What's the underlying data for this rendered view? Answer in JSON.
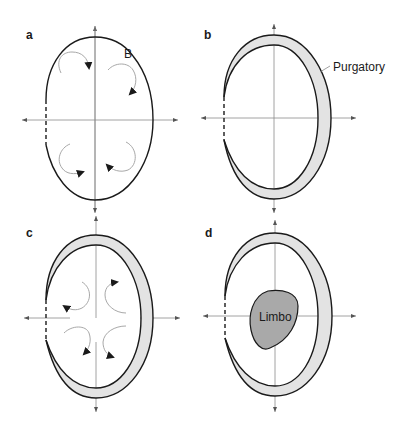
{
  "figure": {
    "panels": [
      {
        "id": "a",
        "label": "a",
        "annotations": [
          {
            "text": "B",
            "meaning": "boundary"
          }
        ],
        "flow_arrows": 4,
        "regions": []
      },
      {
        "id": "b",
        "label": "b",
        "annotations": [
          {
            "text": "Purgatory"
          }
        ],
        "regions": [
          "Purgatory"
        ]
      },
      {
        "id": "c",
        "label": "c",
        "annotations": [],
        "flow_arrows": 4,
        "regions": [
          "Purgatory"
        ]
      },
      {
        "id": "d",
        "label": "d",
        "annotations": [
          {
            "text": "Limbo"
          }
        ],
        "regions": [
          "Purgatory",
          "Limbo"
        ]
      }
    ],
    "labels": {
      "a": "a",
      "b": "b",
      "c": "c",
      "d": "d",
      "boundary": "B",
      "purgatory": "Purgatory",
      "limbo": "Limbo"
    },
    "colors": {
      "purgatory_fill": "#e3e3e3",
      "limbo_fill": "#a9a9a9",
      "boundary_stroke": "#1a1a1a",
      "axis_stroke": "#8a8a8a",
      "flow_stroke": "#a8a8a8"
    }
  }
}
